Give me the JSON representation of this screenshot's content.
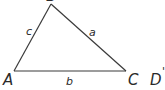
{
  "diagram": {
    "type": "triangle",
    "stroke_color": "#3a3a3a",
    "background": "#ffffff",
    "vertices": {
      "A": {
        "label": "A",
        "x": 14,
        "y": 71
      },
      "B": {
        "label": "B",
        "x": 51,
        "y": 4
      },
      "C": {
        "label": "C",
        "x": 126,
        "y": 71
      }
    },
    "sides": {
      "a": {
        "label": "a",
        "between": "B-C"
      },
      "b": {
        "label": "b",
        "between": "A-C"
      },
      "c": {
        "label": "c",
        "between": "A-B"
      }
    },
    "extra_point": {
      "label": "D",
      "mark": "'"
    }
  }
}
